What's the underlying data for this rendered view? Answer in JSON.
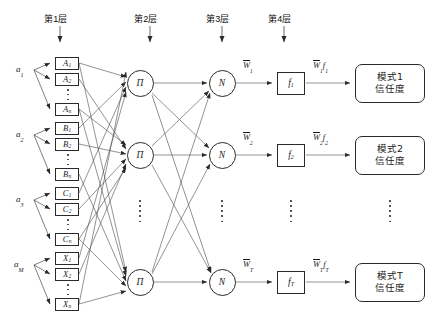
{
  "diagram": {
    "type": "fuzzy-neural-network",
    "layer_labels": [
      {
        "id": "layer1",
        "text": "第1层",
        "x": 50,
        "y": 14
      },
      {
        "id": "layer2",
        "text": "第2层",
        "x": 140,
        "y": 14
      },
      {
        "id": "layer3",
        "text": "第3层",
        "x": 212,
        "y": 14
      },
      {
        "id": "layer4",
        "text": "第4层",
        "x": 274,
        "y": 14
      }
    ],
    "inputs": [
      {
        "id": "a1",
        "base": "a",
        "sub": "1",
        "x": 18,
        "y": 66
      },
      {
        "id": "a2",
        "base": "a",
        "sub": "2",
        "x": 18,
        "y": 131
      },
      {
        "id": "a3",
        "base": "a",
        "sub": "3",
        "x": 18,
        "y": 196
      },
      {
        "id": "aM",
        "base": "a",
        "sub": "M",
        "x": 18,
        "y": 261
      }
    ],
    "membership_groups": [
      {
        "group": "A",
        "boxes": [
          {
            "label": "A",
            "sub": "1",
            "x": 55,
            "y": 57
          },
          {
            "label": "A",
            "sub": "2",
            "x": 55,
            "y": 73
          },
          {
            "label": "A",
            "sub": "n",
            "x": 55,
            "y": 103
          }
        ],
        "dots": {
          "x": 67,
          "y": 89,
          "h": 11
        }
      },
      {
        "group": "B",
        "boxes": [
          {
            "label": "B",
            "sub": "1",
            "x": 55,
            "y": 122
          },
          {
            "label": "B",
            "sub": "2",
            "x": 55,
            "y": 138
          },
          {
            "label": "B",
            "sub": "n",
            "x": 55,
            "y": 168
          }
        ],
        "dots": {
          "x": 67,
          "y": 154,
          "h": 11
        }
      },
      {
        "group": "C",
        "boxes": [
          {
            "label": "C",
            "sub": "1",
            "x": 55,
            "y": 187
          },
          {
            "label": "C",
            "sub": "2",
            "x": 55,
            "y": 203
          },
          {
            "label": "C",
            "sub": "n",
            "x": 55,
            "y": 233
          }
        ],
        "dots": {
          "x": 67,
          "y": 219,
          "h": 11
        }
      },
      {
        "group": "X",
        "boxes": [
          {
            "label": "X",
            "sub": "1",
            "x": 55,
            "y": 252
          },
          {
            "label": "X",
            "sub": "2",
            "x": 55,
            "y": 268
          },
          {
            "label": "X",
            "sub": "n",
            "x": 55,
            "y": 298
          }
        ],
        "dots": {
          "x": 67,
          "y": 284,
          "h": 11
        }
      }
    ],
    "pi_nodes": [
      {
        "id": "pi1",
        "symbol": "Π",
        "cx": 140,
        "cy": 83
      },
      {
        "id": "pi2",
        "symbol": "Π",
        "cx": 140,
        "cy": 155
      },
      {
        "id": "piT",
        "symbol": "Π",
        "cx": 140,
        "cy": 282
      }
    ],
    "n_nodes": [
      {
        "id": "n1",
        "symbol": "N",
        "cx": 222,
        "cy": 83
      },
      {
        "id": "n2",
        "symbol": "N",
        "cx": 222,
        "cy": 155
      },
      {
        "id": "nT",
        "symbol": "N",
        "cx": 222,
        "cy": 282
      }
    ],
    "f_boxes": [
      {
        "id": "f1",
        "base": "f",
        "sub": "1",
        "x": 277,
        "y": 71
      },
      {
        "id": "f2",
        "base": "f",
        "sub": "2",
        "x": 277,
        "y": 143
      },
      {
        "id": "fT",
        "base": "f",
        "sub": "T",
        "x": 277,
        "y": 270
      }
    ],
    "weight_labels": [
      {
        "id": "w1",
        "base": "W",
        "sub": "1",
        "x": 244,
        "y": 62
      },
      {
        "id": "w2",
        "base": "W",
        "sub": "2",
        "x": 244,
        "y": 134
      },
      {
        "id": "wT",
        "base": "W",
        "sub": "T",
        "x": 244,
        "y": 261
      }
    ],
    "product_labels": [
      {
        "id": "wf1",
        "base": "W",
        "sub": "1",
        "f": "f",
        "fsub": "1",
        "x": 316,
        "y": 62
      },
      {
        "id": "wf2",
        "base": "W",
        "sub": "2",
        "f": "f",
        "fsub": "2",
        "x": 316,
        "y": 134
      },
      {
        "id": "wfT",
        "base": "W",
        "sub": "T",
        "f": "f",
        "fsub": "T",
        "x": 316,
        "y": 261
      }
    ],
    "outputs": [
      {
        "id": "out1",
        "line1": "模式1",
        "line2": "信任度",
        "x": 355,
        "y": 60
      },
      {
        "id": "out2",
        "line1": "模式2",
        "line2": "信任度",
        "x": 355,
        "y": 132
      },
      {
        "id": "outT",
        "line1": "模式T",
        "line2": "信任度",
        "x": 355,
        "y": 259
      }
    ],
    "column_ellipses": [
      {
        "id": "pi-dots",
        "x": 139,
        "y": 200,
        "h": 22
      },
      {
        "id": "n-dots",
        "x": 221,
        "y": 200,
        "h": 22
      },
      {
        "id": "f-dots",
        "x": 290,
        "y": 200,
        "h": 22
      },
      {
        "id": "out-dots",
        "x": 389,
        "y": 200,
        "h": 22
      }
    ],
    "colors": {
      "stroke": "#2a2a2a",
      "wire": "#555555",
      "background": "#ffffff",
      "text": "#1a1a1a"
    }
  }
}
